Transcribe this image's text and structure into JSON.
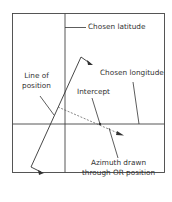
{
  "diagram": {
    "type": "celestial-navigation-plot",
    "labels": {
      "chosen_latitude": "Chosen latitude",
      "chosen_longitude": "Chosen longitude",
      "line_of_position_1": "Line of",
      "line_of_position_2": "position",
      "intercept": "Intercept",
      "azimuth_1": "Azimuth drawn",
      "azimuth_2": "through OR position"
    },
    "colors": {
      "line": "#333333",
      "background": "#ffffff"
    }
  }
}
